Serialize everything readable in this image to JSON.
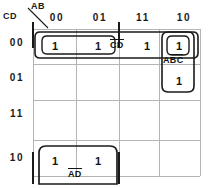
{
  "diagram": {
    "type": "karnaugh-map",
    "corner": {
      "row_var_label": "CD",
      "col_var_label": "AB"
    },
    "columns": [
      "00",
      "01",
      "11",
      "10"
    ],
    "rows": [
      "00",
      "01",
      "11",
      "10"
    ],
    "cells": [
      [
        "1",
        "1",
        "1",
        "1"
      ],
      [
        "",
        "",
        "",
        "1"
      ],
      [
        "",
        "",
        "",
        ""
      ],
      [
        "1",
        "1",
        "",
        ""
      ]
    ],
    "groups": [
      {
        "name": "group-cd",
        "label_plain": "CD",
        "label_parts": [
          {
            "text": "C",
            "overbar": true
          },
          {
            "text": "D",
            "overbar": true
          }
        ],
        "covers": "row 00, columns 00 01 11 10"
      },
      {
        "name": "group-abc",
        "label_plain": "ABC",
        "label_parts": [
          {
            "text": "A",
            "overbar": false
          },
          {
            "text": "B",
            "overbar": true
          },
          {
            "text": "C",
            "overbar": true
          }
        ],
        "covers": "column 10, rows 00 01"
      },
      {
        "name": "group-ad",
        "label_plain": "AD",
        "label_parts": [
          {
            "text": "A",
            "overbar": true
          },
          {
            "text": "D",
            "overbar": true
          }
        ],
        "covers": "row 10, columns 00 01"
      }
    ],
    "colors": {
      "grid_line": "#b4b4b4",
      "group_outline": "#1a1a1a",
      "text": "#141414",
      "background": "#ffffff"
    }
  }
}
